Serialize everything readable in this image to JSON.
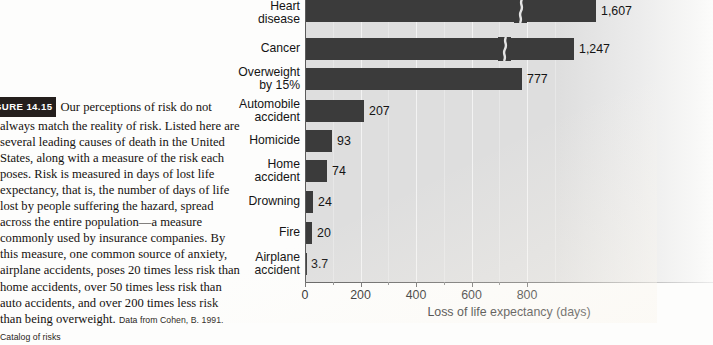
{
  "caption": {
    "badge": "GURE 14.15",
    "body": "Our perceptions of risk do not always match the reality of risk. Listed here are several leading causes of death in the United States, along with a measure of the risk each poses. Risk is measured in days of lost life expectancy, that is, the number of days of life lost by people suffering the hazard, spread across the entire population—a measure commonly used by insurance companies. By this measure, one common source of anxiety, airplane accidents, poses 20 times less risk than home accidents, over 50 times less risk than auto accidents, and over 200 times less risk than being overweight. ",
    "source": "Data from Cohen, B. 1991. Catalog of risks"
  },
  "chart_data": {
    "type": "bar",
    "orientation": "horizontal",
    "title": "",
    "xlabel": "Loss of life expectancy (days)",
    "ylabel": "",
    "xlim": [
      0,
      920
    ],
    "xticks": [
      0,
      200,
      400,
      600,
      800
    ],
    "xticklabels": [
      "0",
      "200",
      "400",
      "600",
      "800"
    ],
    "minor_ticks": [
      100,
      300,
      500,
      700
    ],
    "grid": "vertical-white",
    "legend": "none",
    "categories": [
      "Heart\ndisease",
      "Cancer",
      "Overweight\nby 15%",
      "Automobile\naccident",
      "Homicide",
      "Home\naccident",
      "Drowning",
      "Fire",
      "Airplane\naccident"
    ],
    "values": [
      1607,
      1247,
      777,
      207,
      93,
      74,
      24,
      20,
      3.7
    ],
    "value_labels": [
      "1,607",
      "1,247",
      "777",
      "207",
      "93",
      "74",
      "24",
      "20",
      "3.7"
    ],
    "axis_break": [
      true,
      true,
      false,
      false,
      false,
      false,
      false,
      false,
      false
    ],
    "bar_color": "#3b3b3b",
    "plot_background": "#dedede",
    "gridline_color": "#f4f4f4"
  },
  "geometry": {
    "bars": [
      {
        "top": 0,
        "width": 290,
        "break_x": 208,
        "label_x": 296
      },
      {
        "top": 38,
        "width": 268,
        "break_x": 192,
        "label_x": 274
      },
      {
        "top": 68,
        "width": 216,
        "break_x": null,
        "label_x": 222
      },
      {
        "top": 100,
        "width": 58,
        "break_x": null,
        "label_x": 64
      },
      {
        "top": 130,
        "width": 26,
        "break_x": null,
        "label_x": 32
      },
      {
        "top": 160,
        "width": 21,
        "break_x": null,
        "label_x": 27
      },
      {
        "top": 191,
        "width": 7,
        "break_x": null,
        "label_x": 13
      },
      {
        "top": 222,
        "width": 6,
        "break_x": null,
        "label_x": 12
      },
      {
        "top": 253,
        "width": 1,
        "break_x": null,
        "label_x": 6
      }
    ],
    "label_tops": [
      0,
      42,
      66,
      98,
      134,
      158,
      195,
      226,
      251
    ],
    "gridlines_major": [
      55.5,
      111,
      166.5,
      222
    ],
    "gridlines_minor": [
      27.75,
      83.25,
      138.75,
      194.25,
      249.75
    ],
    "tick_positions": [
      0,
      55.5,
      111,
      166.5,
      222
    ],
    "minor_tick_positions": [
      27.75,
      83.25,
      138.75,
      194.25
    ]
  }
}
